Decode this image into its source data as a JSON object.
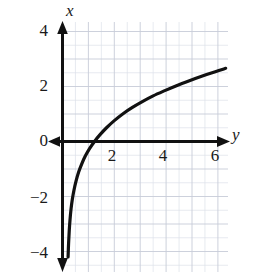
{
  "chart_data": {
    "type": "line",
    "title": "",
    "subtitle": "",
    "xlabel": "y",
    "ylabel": "x",
    "grid": true,
    "grid_minor_step": 0.5,
    "grid_major_step": 1,
    "legend": "none",
    "xlim": [
      -0.25,
      6.5
    ],
    "ylim": [
      -4.4,
      4.5
    ],
    "xticks": [
      2,
      4,
      6
    ],
    "xtick_labels": [
      "2",
      "4",
      "6"
    ],
    "yticks": [
      4,
      2,
      0,
      -2,
      -4
    ],
    "ytick_labels": [
      "4",
      "2",
      "0",
      "−2",
      "−4"
    ],
    "axis_arrows": {
      "x_positive": true,
      "x_negative": true,
      "y_positive": true,
      "y_negative": true
    },
    "series": [
      {
        "name": "x = log(y)",
        "color": "#111111",
        "line_width": 3,
        "points": [
          [
            0.215,
            -4.2
          ],
          [
            0.235,
            -3.7
          ],
          [
            0.26,
            -3.25
          ],
          [
            0.29,
            -2.85
          ],
          [
            0.33,
            -2.45
          ],
          [
            0.38,
            -2.1
          ],
          [
            0.44,
            -1.78
          ],
          [
            0.52,
            -1.45
          ],
          [
            0.62,
            -1.12
          ],
          [
            0.74,
            -0.82
          ],
          [
            0.88,
            -0.53
          ],
          [
            1.05,
            -0.25
          ],
          [
            1.25,
            0.02
          ],
          [
            1.45,
            0.25
          ],
          [
            1.7,
            0.5
          ],
          [
            2.0,
            0.76
          ],
          [
            2.35,
            1.02
          ],
          [
            2.7,
            1.24
          ],
          [
            3.1,
            1.46
          ],
          [
            3.5,
            1.66
          ],
          [
            3.95,
            1.85
          ],
          [
            4.4,
            2.03
          ],
          [
            4.9,
            2.21
          ],
          [
            5.4,
            2.38
          ],
          [
            5.9,
            2.54
          ],
          [
            6.3,
            2.66
          ]
        ]
      }
    ],
    "annotations": [
      {
        "text": "x",
        "role": "y-axis-name",
        "italic": true
      },
      {
        "text": "y",
        "role": "x-axis-name",
        "italic": true
      }
    ],
    "colors": {
      "curve": "#111111",
      "axis": "#111111",
      "grid_minor": "#d9dde6",
      "grid_major": "#c3c8d4",
      "background": "#ffffff",
      "text": "#1a1a1a"
    }
  },
  "labels": {
    "axis_x_name": "x",
    "axis_y_name": "y",
    "ytick_4": "4",
    "ytick_2": "2",
    "ytick_0": "0",
    "ytick_neg2": "−2",
    "ytick_neg4": "−4",
    "xtick_2": "2",
    "xtick_4": "4",
    "xtick_6": "6"
  }
}
